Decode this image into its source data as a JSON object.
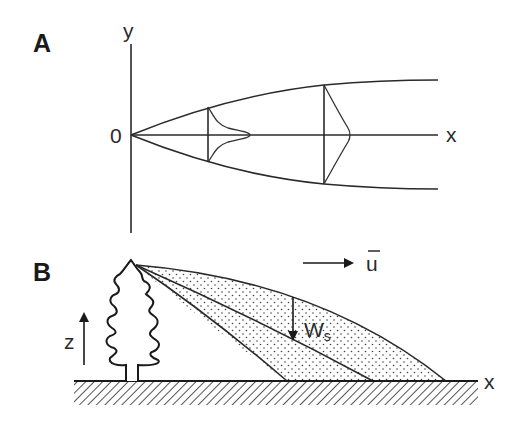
{
  "panels": {
    "a": {
      "label": "A",
      "y_axis_label": "y",
      "x_axis_label": "x",
      "origin_label": "0",
      "description": "Plume spreading from origin along x with Gaussian-like cross-wind concentration profiles at two downstream sections"
    },
    "b": {
      "label": "B",
      "z_axis_label": "z",
      "x_axis_label": "x",
      "wind_label": "ū",
      "settling_label": "W",
      "settling_subscript": "s",
      "description": "Particle plume released from top of a tree, advected by mean wind and settling to the ground"
    }
  },
  "colors": {
    "ink": "#2a2a2a",
    "background": "#ffffff"
  }
}
